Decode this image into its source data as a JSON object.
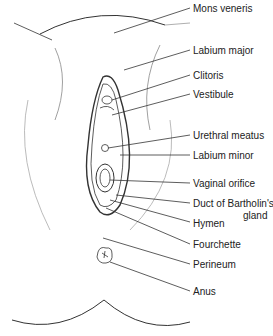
{
  "diagram": {
    "type": "anatomical-illustration",
    "labels": [
      {
        "id": "mons-veneris",
        "text": "Mons veneris",
        "x": 193,
        "y": 3
      },
      {
        "id": "labium-major",
        "text": "Labium major",
        "x": 193,
        "y": 45
      },
      {
        "id": "clitoris",
        "text": "Clitoris",
        "x": 193,
        "y": 70
      },
      {
        "id": "vestibule",
        "text": "Vestibule",
        "x": 193,
        "y": 89
      },
      {
        "id": "urethral-meatus",
        "text": "Urethral meatus",
        "x": 193,
        "y": 130
      },
      {
        "id": "labium-minor",
        "text": "Labium minor",
        "x": 193,
        "y": 150
      },
      {
        "id": "vaginal-orifice",
        "text": "Vaginal orifice",
        "x": 193,
        "y": 178
      },
      {
        "id": "duct-of-bartholins-gland",
        "text": "Duct of Bartholin's",
        "x": 193,
        "y": 198
      },
      {
        "id": "duct-of-bartholins-gland-2",
        "text": "gland",
        "x": 243,
        "y": 210
      },
      {
        "id": "hymen",
        "text": "Hymen",
        "x": 193,
        "y": 218
      },
      {
        "id": "fourchette",
        "text": "Fourchette",
        "x": 193,
        "y": 239
      },
      {
        "id": "perineum",
        "text": "Perineum",
        "x": 193,
        "y": 259
      },
      {
        "id": "anus",
        "text": "Anus",
        "x": 193,
        "y": 286
      }
    ]
  }
}
